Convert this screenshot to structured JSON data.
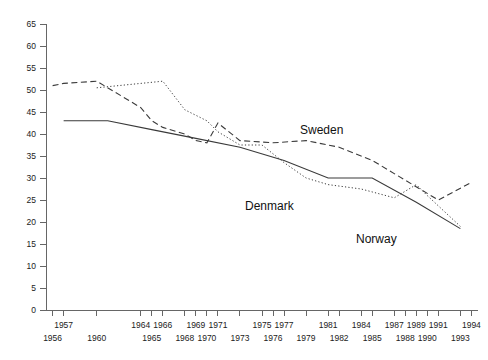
{
  "chart_data": {
    "type": "line",
    "title": "",
    "subtitle": "",
    "xlabel": "",
    "ylabel": "",
    "ylim": [
      0,
      65
    ],
    "yticks": [
      0,
      5,
      10,
      15,
      20,
      25,
      30,
      35,
      40,
      45,
      50,
      55,
      60,
      65
    ],
    "ytick_labels": [
      "0",
      "5",
      "10",
      "15",
      "20",
      "25",
      "30",
      "35",
      "40",
      "45",
      "50",
      "55",
      "60",
      "65"
    ],
    "grid": false,
    "legend": "inline-labels",
    "x_axis_rows": {
      "upper": [
        "1957",
        "1964",
        "1966",
        "1969",
        "1971",
        "1975",
        "1977",
        "1981",
        "1984",
        "1987",
        "1989",
        "1991",
        "1994"
      ],
      "lower": [
        "1956",
        "1960",
        "1965",
        "1968",
        "1970",
        "1973",
        "1976",
        "1979",
        "1982",
        "1985",
        "1988",
        "1990",
        "1993"
      ]
    },
    "x_categories": [
      "1956",
      "1957",
      "1960",
      "1964",
      "1965",
      "1966",
      "1968",
      "1969",
      "1970",
      "1971",
      "1973",
      "1975",
      "1976",
      "1977",
      "1979",
      "1981",
      "1982",
      "1984",
      "1985",
      "1987",
      "1988",
      "1989",
      "1990",
      "1991",
      "1993",
      "1994"
    ],
    "series": [
      {
        "name": "Sweden",
        "style": "dashed",
        "color": "#3a3a3a",
        "x": [
          "1956",
          "1957",
          "1960",
          "1964",
          "1965",
          "1966",
          "1968",
          "1969",
          "1970",
          "1971",
          "1973",
          "1976",
          "1979",
          "1982",
          "1985",
          "1988",
          "1991",
          "1994"
        ],
        "values": [
          51.0,
          51.5,
          52.0,
          46.0,
          43.0,
          41.5,
          40.0,
          38.5,
          38.0,
          42.5,
          38.5,
          38.0,
          38.5,
          37.0,
          34.0,
          29.5,
          25.0,
          29.0
        ]
      },
      {
        "name": "Denmark",
        "style": "dotted",
        "color": "#3a3a3a",
        "x": [
          "1960",
          "1964",
          "1966",
          "1968",
          "1970",
          "1971",
          "1973",
          "1975",
          "1977",
          "1979",
          "1981",
          "1984",
          "1987",
          "1989",
          "1990",
          "1993"
        ],
        "values": [
          50.5,
          51.5,
          52.0,
          45.5,
          43.0,
          40.5,
          37.5,
          37.5,
          33.5,
          30.0,
          28.5,
          27.5,
          25.5,
          28.5,
          26.0,
          19.0
        ]
      },
      {
        "name": "Norway",
        "style": "solid",
        "color": "#3a3a3a",
        "x": [
          "1957",
          "1961",
          "1965",
          "1969",
          "1973",
          "1977",
          "1981",
          "1985",
          "1989",
          "1993"
        ],
        "values": [
          43.0,
          43.0,
          41.0,
          39.0,
          37.0,
          34.0,
          30.0,
          30.0,
          24.5,
          18.5
        ]
      }
    ],
    "annotations": [
      {
        "text": "Sweden",
        "x_px": 300,
        "y_px": 134
      },
      {
        "text": "Denmark",
        "x_px": 245,
        "y_px": 210
      },
      {
        "text": "Norway",
        "x_px": 356,
        "y_px": 243
      }
    ]
  }
}
